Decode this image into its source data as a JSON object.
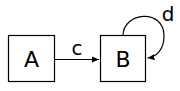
{
  "diagram": {
    "type": "state-graph",
    "nodes": [
      {
        "id": "A",
        "label": "A"
      },
      {
        "id": "B",
        "label": "B"
      }
    ],
    "edges": [
      {
        "from": "A",
        "to": "B",
        "label": "c"
      },
      {
        "from": "B",
        "to": "B",
        "label": "d"
      }
    ],
    "colors": {
      "stroke": "#000000",
      "background": "#ffffff"
    }
  }
}
